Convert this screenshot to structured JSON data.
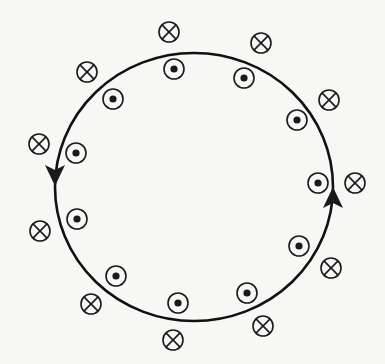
{
  "diagram": {
    "title": "",
    "loop": {
      "label": "current loop",
      "cx": 194,
      "cy": 187,
      "rx": 139,
      "ry": 134,
      "stroke": "#111111",
      "direction": "counterclockwise",
      "arrows": [
        {
          "name": "arrow-down-left",
          "x": 55,
          "y": 174,
          "direction": "down"
        },
        {
          "name": "arrow-up-right",
          "x": 333,
          "y": 199,
          "direction": "up"
        }
      ]
    },
    "symbols_legend": {
      "out_of_page": "dot (field out of page)",
      "into_page": "cross (field into page)"
    },
    "inside_dots": [
      {
        "x": 174,
        "y": 69
      },
      {
        "x": 244,
        "y": 78
      },
      {
        "x": 297,
        "y": 120
      },
      {
        "x": 318,
        "y": 183
      },
      {
        "x": 299,
        "y": 246
      },
      {
        "x": 247,
        "y": 293
      },
      {
        "x": 178,
        "y": 303
      },
      {
        "x": 116,
        "y": 276
      },
      {
        "x": 77,
        "y": 219
      },
      {
        "x": 76,
        "y": 153
      },
      {
        "x": 113,
        "y": 99
      }
    ],
    "outside_crosses": [
      {
        "x": 169,
        "y": 32
      },
      {
        "x": 261,
        "y": 43
      },
      {
        "x": 329,
        "y": 100
      },
      {
        "x": 355,
        "y": 183
      },
      {
        "x": 331,
        "y": 268
      },
      {
        "x": 263,
        "y": 326
      },
      {
        "x": 173,
        "y": 340
      },
      {
        "x": 91,
        "y": 304
      },
      {
        "x": 40,
        "y": 231
      },
      {
        "x": 39,
        "y": 144
      },
      {
        "x": 87,
        "y": 72
      }
    ],
    "symbol_radius": 10,
    "dot_radius": 3.6,
    "colors": {
      "ink": "#1a1a1a",
      "background": "#f7f7f5"
    }
  }
}
